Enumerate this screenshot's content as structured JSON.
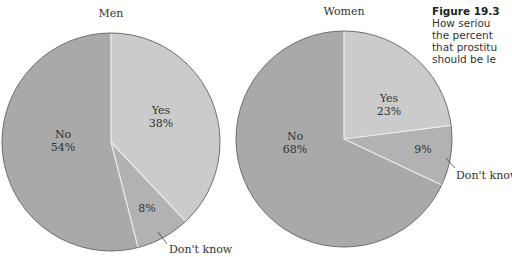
{
  "caption": {
    "title": "Figure 19.3",
    "lines": [
      "How seriou",
      "the percent",
      "that prostitu",
      "should be le"
    ]
  },
  "colors": {
    "yes": "#cbcbcb",
    "no": "#a9a9a9",
    "dont_know": "#b2b2b2",
    "outline": "#6f6f6f",
    "separator": "#eeeeee"
  },
  "chart_data": [
    {
      "type": "pie",
      "title": "Men",
      "categories": [
        "Yes",
        "Don't know",
        "No"
      ],
      "values": [
        38,
        8,
        54
      ],
      "labels": {
        "yes": "Yes",
        "yes_pct": "38%",
        "no": "No",
        "no_pct": "54%",
        "dk_pct": "8%",
        "dk_callout": "Don't know"
      }
    },
    {
      "type": "pie",
      "title": "Women",
      "categories": [
        "Yes",
        "Don't know",
        "No"
      ],
      "values": [
        23,
        9,
        68
      ],
      "labels": {
        "yes": "Yes",
        "yes_pct": "23%",
        "no": "No",
        "no_pct": "68%",
        "dk_pct": "9%",
        "dk_callout": "Don't know"
      }
    }
  ]
}
